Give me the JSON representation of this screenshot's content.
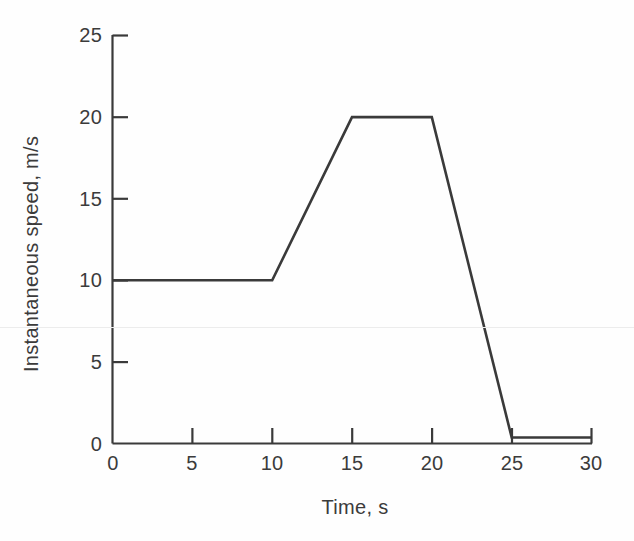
{
  "chart_data": {
    "type": "line",
    "title": "",
    "xlabel": "Time, s",
    "ylabel": "Instantaneous speed, m/s",
    "xlim": [
      0,
      30
    ],
    "ylim": [
      0,
      25
    ],
    "xticks": [
      0,
      5,
      10,
      15,
      20,
      25,
      30
    ],
    "yticks": [
      0,
      5,
      10,
      15,
      20,
      25
    ],
    "xtick_labels": [
      "0",
      "5",
      "10",
      "15",
      "20",
      "25",
      "30"
    ],
    "ytick_labels": [
      "0",
      "5",
      "10",
      "15",
      "20",
      "25"
    ],
    "grid": false,
    "legend": null,
    "series": [
      {
        "name": "Instantaneous speed",
        "color": "#3a3a3a",
        "x": [
          0,
          10,
          15,
          20,
          25,
          30
        ],
        "values": [
          10,
          10,
          20,
          20,
          0,
          0
        ]
      }
    ],
    "annotations": []
  },
  "axes": {
    "x_title": "Time, s",
    "y_title": "Instantaneous speed, m/s"
  },
  "colors": {
    "line": "#3a3a3a",
    "axis": "#3a3a3a",
    "text": "#3b3b3b",
    "background": "#fefefe",
    "scanline": "#ececec"
  }
}
